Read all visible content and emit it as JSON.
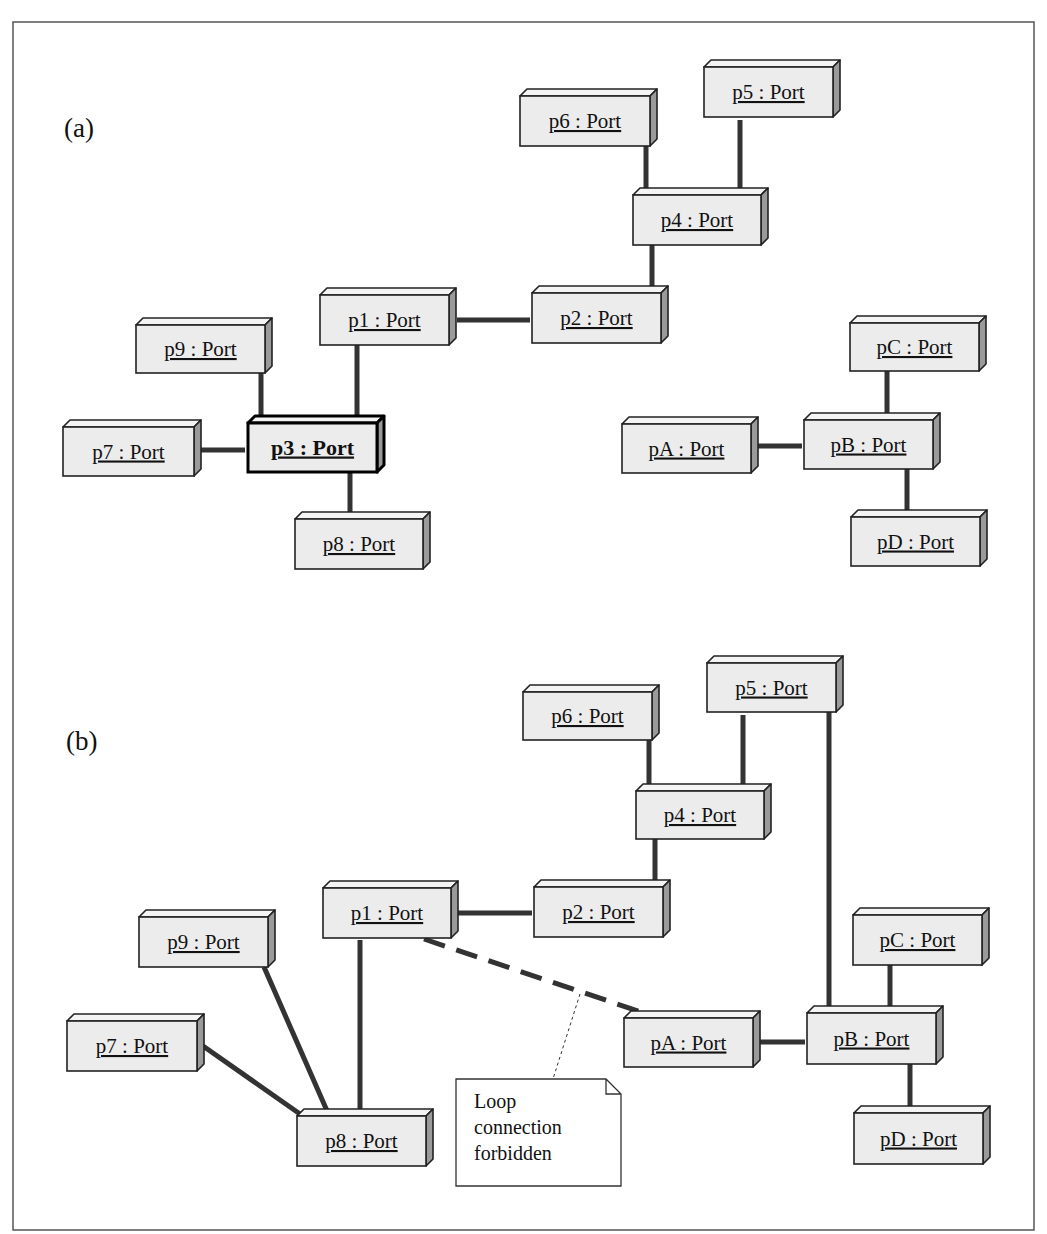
{
  "diagram": {
    "frame": {
      "x": 13,
      "y": 22,
      "w": 1021,
      "h": 1208
    },
    "panels": [
      {
        "id": "a",
        "label": "(a)",
        "label_pos": {
          "x": 64,
          "y": 137
        },
        "boxes": [
          {
            "id": "p6",
            "label": "p6 : Port",
            "x": 520,
            "y": 96,
            "w": 130,
            "h": 50
          },
          {
            "id": "p5",
            "label": "p5 : Port",
            "x": 704,
            "y": 67,
            "w": 129,
            "h": 50
          },
          {
            "id": "p4",
            "label": "p4 : Port",
            "x": 633,
            "y": 195,
            "w": 128,
            "h": 50
          },
          {
            "id": "p2",
            "label": "p2 : Port",
            "x": 532,
            "y": 293,
            "w": 129,
            "h": 50
          },
          {
            "id": "p1",
            "label": "p1 : Port",
            "x": 320,
            "y": 295,
            "w": 129,
            "h": 50
          },
          {
            "id": "p9",
            "label": "p9 : Port",
            "x": 136,
            "y": 325,
            "w": 129,
            "h": 48
          },
          {
            "id": "p7",
            "label": "p7 : Port",
            "x": 63,
            "y": 427,
            "w": 131,
            "h": 49
          },
          {
            "id": "p3",
            "label": "p3 : Port",
            "x": 248,
            "y": 423,
            "w": 129,
            "h": 49,
            "bold": true
          },
          {
            "id": "p8",
            "label": "p8 : Port",
            "x": 295,
            "y": 519,
            "w": 128,
            "h": 50
          },
          {
            "id": "pC",
            "label": "pC : Port",
            "x": 850,
            "y": 323,
            "w": 129,
            "h": 48
          },
          {
            "id": "pA",
            "label": "pA : Port",
            "x": 622,
            "y": 424,
            "w": 129,
            "h": 49
          },
          {
            "id": "pB",
            "label": "pB : Port",
            "x": 804,
            "y": 420,
            "w": 129,
            "h": 49
          },
          {
            "id": "pD",
            "label": "pD : Port",
            "x": 851,
            "y": 517,
            "w": 129,
            "h": 49
          }
        ],
        "connectors": [
          {
            "from": "p6",
            "to": "p4",
            "x1": 646,
            "y1": 146,
            "x2": 646,
            "y2": 190,
            "style": "solid"
          },
          {
            "from": "p5",
            "to": "p4",
            "x1": 740,
            "y1": 120,
            "x2": 740,
            "y2": 190,
            "style": "solid"
          },
          {
            "from": "p4",
            "to": "p2",
            "x1": 652,
            "y1": 245,
            "x2": 652,
            "y2": 288,
            "style": "solid"
          },
          {
            "from": "p1",
            "to": "p2",
            "x1": 457,
            "y1": 320,
            "x2": 530,
            "y2": 320,
            "style": "solid"
          },
          {
            "from": "p1",
            "to": "p3",
            "x1": 357,
            "y1": 345,
            "x2": 357,
            "y2": 418,
            "style": "solid"
          },
          {
            "from": "p9",
            "to": "p3",
            "x1": 261,
            "y1": 373,
            "x2": 261,
            "y2": 418,
            "style": "solid"
          },
          {
            "from": "p7",
            "to": "p3",
            "x1": 200,
            "y1": 450,
            "x2": 245,
            "y2": 450,
            "style": "solid"
          },
          {
            "from": "p3",
            "to": "p8",
            "x1": 350,
            "y1": 472,
            "x2": 350,
            "y2": 514,
            "style": "solid"
          },
          {
            "from": "pC",
            "to": "pB",
            "x1": 887,
            "y1": 371,
            "x2": 887,
            "y2": 415,
            "style": "solid"
          },
          {
            "from": "pA",
            "to": "pB",
            "x1": 757,
            "y1": 446,
            "x2": 802,
            "y2": 446,
            "style": "solid"
          },
          {
            "from": "pB",
            "to": "pD",
            "x1": 907,
            "y1": 469,
            "x2": 907,
            "y2": 512,
            "style": "solid"
          }
        ]
      },
      {
        "id": "b",
        "label": "(b)",
        "label_pos": {
          "x": 66,
          "y": 750
        },
        "boxes": [
          {
            "id": "p6",
            "label": "p6 : Port",
            "x": 523,
            "y": 692,
            "w": 129,
            "h": 48
          },
          {
            "id": "p5",
            "label": "p5 : Port",
            "x": 707,
            "y": 663,
            "w": 129,
            "h": 49
          },
          {
            "id": "p4",
            "label": "p4 : Port",
            "x": 636,
            "y": 791,
            "w": 128,
            "h": 48
          },
          {
            "id": "p2",
            "label": "p2 : Port",
            "x": 534,
            "y": 887,
            "w": 129,
            "h": 50
          },
          {
            "id": "p1",
            "label": "p1 : Port",
            "x": 323,
            "y": 888,
            "w": 128,
            "h": 50
          },
          {
            "id": "p9",
            "label": "p9 : Port",
            "x": 139,
            "y": 917,
            "w": 129,
            "h": 50
          },
          {
            "id": "p7",
            "label": "p7 : Port",
            "x": 67,
            "y": 1021,
            "w": 130,
            "h": 50
          },
          {
            "id": "p8",
            "label": "p8 : Port",
            "x": 297,
            "y": 1116,
            "w": 129,
            "h": 50
          },
          {
            "id": "pC",
            "label": "pC : Port",
            "x": 853,
            "y": 915,
            "w": 129,
            "h": 50
          },
          {
            "id": "pA",
            "label": "pA : Port",
            "x": 624,
            "y": 1018,
            "w": 129,
            "h": 49
          },
          {
            "id": "pB",
            "label": "pB : Port",
            "x": 807,
            "y": 1013,
            "w": 129,
            "h": 51
          },
          {
            "id": "pD",
            "label": "pD : Port",
            "x": 854,
            "y": 1113,
            "w": 129,
            "h": 51
          }
        ],
        "connectors": [
          {
            "from": "p6",
            "to": "p4",
            "x1": 649,
            "y1": 740,
            "x2": 649,
            "y2": 786,
            "style": "solid"
          },
          {
            "from": "p5",
            "to": "p4",
            "x1": 743,
            "y1": 715,
            "x2": 743,
            "y2": 786,
            "style": "solid"
          },
          {
            "from": "p4",
            "to": "p2",
            "x1": 655,
            "y1": 839,
            "x2": 655,
            "y2": 882,
            "style": "solid"
          },
          {
            "from": "p1",
            "to": "p2",
            "x1": 458,
            "y1": 913,
            "x2": 532,
            "y2": 913,
            "style": "solid"
          },
          {
            "from": "p5",
            "to": "pB",
            "x1": 829,
            "y1": 712,
            "x2": 829,
            "y2": 1010,
            "style": "solid"
          },
          {
            "from": "p1",
            "to": "p8",
            "x1": 360,
            "y1": 940,
            "x2": 360,
            "y2": 1111,
            "style": "solid"
          },
          {
            "from": "p9",
            "to": "p8",
            "x1": 264,
            "y1": 967,
            "x2": 328,
            "y2": 1113,
            "style": "solid"
          },
          {
            "from": "p7",
            "to": "p8",
            "x1": 203,
            "y1": 1046,
            "x2": 300,
            "y2": 1114,
            "style": "solid"
          },
          {
            "from": "pC",
            "to": "pB",
            "x1": 890,
            "y1": 965,
            "x2": 890,
            "y2": 1010,
            "style": "solid"
          },
          {
            "from": "pA",
            "to": "pB",
            "x1": 759,
            "y1": 1042,
            "x2": 805,
            "y2": 1042,
            "style": "solid"
          },
          {
            "from": "pB",
            "to": "pD",
            "x1": 910,
            "y1": 1064,
            "x2": 910,
            "y2": 1108,
            "style": "solid"
          },
          {
            "from": "p1",
            "to": "pA",
            "x1": 424,
            "y1": 939,
            "x2": 650,
            "y2": 1015,
            "style": "dashed"
          }
        ],
        "note": {
          "lines": [
            "Loop",
            "connection",
            "forbidden"
          ],
          "x": 456,
          "y": 1079,
          "w": 165,
          "h": 107,
          "fold": 15,
          "anchor": {
            "x1": 580,
            "y1": 994,
            "x2": 553,
            "y2": 1079
          }
        }
      }
    ]
  }
}
